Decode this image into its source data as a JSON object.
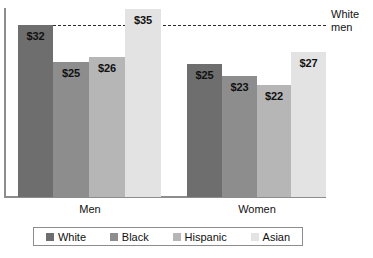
{
  "chart_data": {
    "type": "bar",
    "title": "",
    "subtitle": "",
    "xlabel": "",
    "ylabel": "",
    "categories": [
      "Men",
      "Women"
    ],
    "series": [
      {
        "name": "White",
        "values": [
          32,
          25
        ],
        "color": "#6e6e6e"
      },
      {
        "name": "Black",
        "values": [
          25,
          23
        ],
        "color": "#8d8d8d"
      },
      {
        "name": "Hispanic",
        "values": [
          26,
          22
        ],
        "color": "#b6b6b6"
      },
      {
        "name": "Asian",
        "values": [
          35,
          27
        ],
        "color": "#e3e3e3"
      }
    ],
    "value_labels": [
      [
        "$32",
        "$25",
        "$26",
        "$35"
      ],
      [
        "$25",
        "$23",
        "$22",
        "$27"
      ]
    ],
    "annotations": [
      {
        "name": "white-men-reference",
        "label": "White\nmen",
        "line1": "White",
        "line2": "men",
        "value": 32,
        "style": "dashed"
      }
    ],
    "ylim": [
      0,
      39
    ],
    "grid": false,
    "legend_position": "bottom"
  },
  "legend": {
    "items": [
      {
        "label": "White",
        "color": "#6e6e6e"
      },
      {
        "label": "Black",
        "color": "#8d8d8d"
      },
      {
        "label": "Hispanic",
        "color": "#b6b6b6"
      },
      {
        "label": "Asian",
        "color": "#e3e3e3"
      }
    ]
  },
  "axis": {
    "group_labels": [
      "Men",
      "Women"
    ]
  },
  "reference": {
    "line1": "White",
    "line2": "men"
  },
  "bars": [
    {
      "group": "Men",
      "series": "White",
      "label": "$32",
      "left": 18,
      "width": 35,
      "height": 172,
      "color": "#6e6e6e"
    },
    {
      "group": "Men",
      "series": "Black",
      "label": "$25",
      "left": 53,
      "width": 36,
      "height": 135,
      "color": "#8d8d8d"
    },
    {
      "group": "Men",
      "series": "Hispanic",
      "label": "$26",
      "left": 89,
      "width": 36,
      "height": 140,
      "color": "#b6b6b6"
    },
    {
      "group": "Men",
      "series": "Asian",
      "label": "$35",
      "left": 125,
      "width": 36,
      "height": 188,
      "color": "#e3e3e3"
    },
    {
      "group": "Women",
      "series": "White",
      "label": "$25",
      "left": 187,
      "width": 35,
      "height": 133,
      "color": "#6e6e6e"
    },
    {
      "group": "Women",
      "series": "Black",
      "label": "$23",
      "left": 222,
      "width": 35,
      "height": 121,
      "color": "#8d8d8d"
    },
    {
      "group": "Women",
      "series": "Hispanic",
      "label": "$22",
      "left": 257,
      "width": 34,
      "height": 112,
      "color": "#b6b6b6"
    },
    {
      "group": "Women",
      "series": "Asian",
      "label": "$27",
      "left": 291,
      "width": 35,
      "height": 145,
      "color": "#e3e3e3"
    }
  ],
  "group_label_positions": [
    {
      "label": "Men",
      "left": 55,
      "width": 70
    },
    {
      "label": "Women",
      "left": 222,
      "width": 70
    }
  ]
}
